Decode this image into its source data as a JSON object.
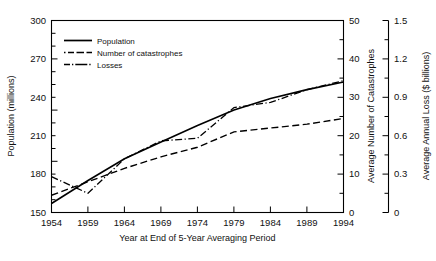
{
  "chart_data": {
    "type": "line",
    "title": "",
    "xlabel": "Year at End of 5-Year Averaging Period",
    "x_ticks": [
      "1954",
      "1959",
      "1964",
      "1969",
      "1974",
      "1979",
      "1984",
      "1989",
      "1994"
    ],
    "x": [
      1954,
      1959,
      1964,
      1969,
      1974,
      1979,
      1984,
      1989,
      1994
    ],
    "xlim": [
      1954,
      1994
    ],
    "grid": false,
    "legend_position": "upper-left-inside",
    "axes": [
      {
        "id": "left",
        "label": "Population (millions)",
        "ticks": [
          "150",
          "180",
          "210",
          "240",
          "270",
          "300"
        ],
        "tick_values": [
          150,
          180,
          210,
          240,
          270,
          300
        ],
        "lim": [
          150,
          300
        ]
      },
      {
        "id": "right-1",
        "label": "Average Number of Catastrophes",
        "ticks": [
          "0",
          "10",
          "20",
          "30",
          "40",
          "50"
        ],
        "tick_values": [
          0,
          10,
          20,
          30,
          40,
          50
        ],
        "lim": [
          0,
          50
        ]
      },
      {
        "id": "right-2",
        "label": "Average Annual Loss ($ billions)",
        "ticks": [
          "0",
          "0.3",
          "0.6",
          "0.9",
          "1.2",
          "1.5"
        ],
        "tick_values": [
          0,
          0.3,
          0.6,
          0.9,
          1.2,
          1.5
        ],
        "lim": [
          0,
          1.5
        ]
      }
    ],
    "series": [
      {
        "name": "Population",
        "axis": "left",
        "style": "solid",
        "unit": "millions",
        "values": [
          157,
          175,
          192,
          205,
          218,
          230,
          239,
          246,
          252
        ]
      },
      {
        "name": "Number of catastrophes",
        "axis": "right-1",
        "style": "dashed",
        "unit": "count",
        "values": [
          4.5,
          8.0,
          11.5,
          14.5,
          17.0,
          21.0,
          22.0,
          23.0,
          24.5
        ]
      },
      {
        "name": "Losses",
        "axis": "right-2",
        "style": "dash-dot",
        "unit": "$ billions",
        "values": [
          0.28,
          0.15,
          0.42,
          0.56,
          0.58,
          0.82,
          0.86,
          0.96,
          1.03
        ]
      }
    ],
    "legend": [
      {
        "label": "Population",
        "style": "solid"
      },
      {
        "label": "Number of catastrophes",
        "style": "dashed"
      },
      {
        "label": "Losses",
        "style": "dash-dot"
      }
    ]
  }
}
